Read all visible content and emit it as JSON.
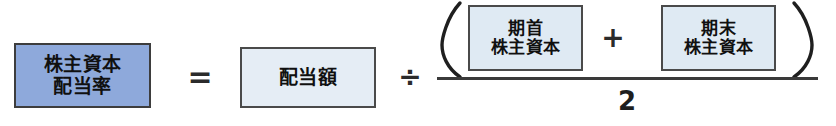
{
  "formula": {
    "name": "株主資本配当率の計算式",
    "left_side": {
      "label_lines": [
        "株主資本",
        "配当率"
      ],
      "fill_color": "#8ea9db",
      "border_color": "#3d3d3d"
    },
    "operators": {
      "equals": "=",
      "divide": "÷",
      "plus": "+",
      "paren_open": "(",
      "paren_close": ")"
    },
    "dividend": {
      "label_lines": [
        "配当額"
      ],
      "fill_color": "#e5edf5",
      "border_color": "#4a4a4a"
    },
    "numerator": {
      "begin_equity": {
        "label_lines": [
          "期首",
          "株主資本"
        ],
        "fill_color": "#dfeaf3",
        "border_color": "#4a4a4a"
      },
      "end_equity": {
        "label_lines": [
          "期末",
          "株主資本"
        ],
        "fill_color": "#dfeaf3",
        "border_color": "#4a4a4a"
      }
    },
    "denominator": "2"
  }
}
